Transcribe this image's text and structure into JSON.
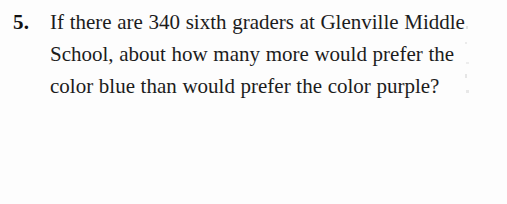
{
  "page": {
    "background_color": "#fdfdfd",
    "text_color": "#1c1c1c"
  },
  "question": {
    "number": "5.",
    "text": "If there are 340 sixth graders at Glenville Middle School, about how many more would prefer the color blue than would prefer the color purple?",
    "lines": [
      "If there are 340 sixth graders at",
      "Glenville Middle School, about",
      "how many more would prefer the",
      "color blue than would prefer the",
      "color purple?"
    ],
    "referenced_values": {
      "total_sixth_graders": "340",
      "school_name": "Glenville Middle School",
      "color_a": "blue",
      "color_b": "purple"
    }
  }
}
